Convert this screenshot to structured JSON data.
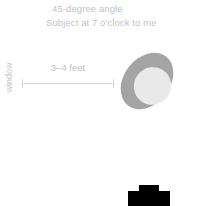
{
  "diagram": {
    "notes": {
      "angle": "45-degree angle",
      "subject_position": "Subject at 7 o'clock to me"
    },
    "window": {
      "label": "window"
    },
    "distance": {
      "label": "3–4 feet"
    },
    "subject": {
      "body_label": "subject-body",
      "head_label": "subject-head"
    },
    "camera": {
      "label": "camera"
    },
    "colors": {
      "background": "#ffffff",
      "text": "#c2c2c2",
      "window_text": "#c9c9c9",
      "dimension_line": "#d6d6d6",
      "subject_body": "#a4a4a4",
      "subject_head": "#e9e9e9",
      "camera": "#000000"
    }
  }
}
